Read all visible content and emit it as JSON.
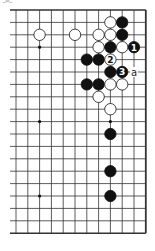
{
  "diagram": {
    "corner_label": "变",
    "board": {
      "visible_columns": 12,
      "visible_rows": 19,
      "edges": {
        "top": true,
        "bottom": true,
        "right": true,
        "left": false
      },
      "grid_color": "#333333",
      "hoshi": [
        {
          "col": 2,
          "row": 3
        },
        {
          "col": 8,
          "row": 3
        },
        {
          "col": 2,
          "row": 9
        },
        {
          "col": 8,
          "row": 9
        },
        {
          "col": 2,
          "row": 15
        },
        {
          "col": 8,
          "row": 15
        }
      ],
      "stones": [
        {
          "col": 8,
          "row": 1,
          "color": "white"
        },
        {
          "col": 9,
          "row": 1,
          "color": "black"
        },
        {
          "col": 2,
          "row": 2,
          "color": "white"
        },
        {
          "col": 5,
          "row": 2,
          "color": "white"
        },
        {
          "col": 7,
          "row": 2,
          "color": "white"
        },
        {
          "col": 8,
          "row": 2,
          "color": "white"
        },
        {
          "col": 9,
          "row": 2,
          "color": "black"
        },
        {
          "col": 7,
          "row": 3,
          "color": "white"
        },
        {
          "col": 8,
          "row": 3,
          "color": "black"
        },
        {
          "col": 9,
          "row": 3,
          "color": "white"
        },
        {
          "col": 10,
          "row": 3,
          "color": "black",
          "label": "1"
        },
        {
          "col": 6,
          "row": 4,
          "color": "black"
        },
        {
          "col": 7,
          "row": 4,
          "color": "black"
        },
        {
          "col": 8,
          "row": 4,
          "color": "white",
          "label": "2"
        },
        {
          "col": 8,
          "row": 5,
          "color": "black"
        },
        {
          "col": 9,
          "row": 5,
          "color": "black",
          "label": "3"
        },
        {
          "col": 6,
          "row": 6,
          "color": "black"
        },
        {
          "col": 7,
          "row": 6,
          "color": "black"
        },
        {
          "col": 8,
          "row": 6,
          "color": "white"
        },
        {
          "col": 9,
          "row": 6,
          "color": "white"
        },
        {
          "col": 7,
          "row": 7,
          "color": "white"
        },
        {
          "col": 8,
          "row": 8,
          "color": "white"
        },
        {
          "col": 8,
          "row": 10,
          "color": "black"
        },
        {
          "col": 8,
          "row": 13,
          "color": "black"
        },
        {
          "col": 8,
          "row": 15,
          "color": "black"
        }
      ],
      "point_labels": [
        {
          "col": 10,
          "row": 5,
          "text": "a"
        }
      ]
    }
  }
}
